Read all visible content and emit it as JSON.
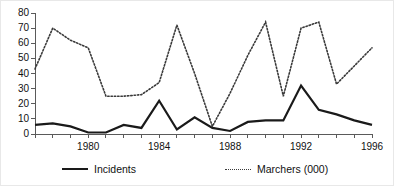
{
  "chart_data": {
    "type": "line",
    "title": "",
    "subtitle": "",
    "xlabel": "",
    "ylabel": "",
    "xlim": [
      1977,
      1996
    ],
    "ylim": [
      0,
      80
    ],
    "grid": false,
    "legend_position": "bottom",
    "x": [
      1977,
      1978,
      1979,
      1980,
      1981,
      1982,
      1983,
      1984,
      1985,
      1986,
      1987,
      1988,
      1989,
      1990,
      1991,
      1992,
      1993,
      1994,
      1995,
      1996
    ],
    "xticks": [
      1977,
      1978,
      1979,
      1980,
      1981,
      1982,
      1983,
      1984,
      1985,
      1986,
      1987,
      1988,
      1989,
      1990,
      1991,
      1992,
      1993,
      1994,
      1995,
      1996
    ],
    "xtick_labels": [
      "1980",
      "1984",
      "1988",
      "1992",
      "1996"
    ],
    "xtick_label_values": [
      1980,
      1984,
      1988,
      1992,
      1996
    ],
    "yticks": [
      0,
      10,
      20,
      30,
      40,
      50,
      60,
      70,
      80
    ],
    "ytick_labels": [
      "0",
      "10",
      "20",
      "30",
      "40",
      "50",
      "60",
      "70",
      "80"
    ],
    "series": [
      {
        "name": "Incidents",
        "style": "solid",
        "color": "#1a1a1a",
        "width": 2.2,
        "values": [
          6,
          7,
          5,
          1,
          1,
          6,
          4,
          22,
          3,
          11,
          4,
          2,
          8,
          9,
          9,
          32,
          16,
          13,
          9,
          6
        ]
      },
      {
        "name": "Marchers (000)",
        "style": "dotted",
        "color": "#3a3a3a",
        "width": 1.6,
        "values": [
          43,
          70,
          62,
          57,
          25,
          25,
          26,
          34,
          72,
          40,
          5,
          27,
          52,
          74,
          25,
          70,
          74,
          33,
          45,
          57
        ]
      }
    ]
  },
  "legend": {
    "items": [
      {
        "label": "Incidents",
        "style": "solid"
      },
      {
        "label": "Marchers (000)",
        "style": "dotted"
      }
    ]
  }
}
